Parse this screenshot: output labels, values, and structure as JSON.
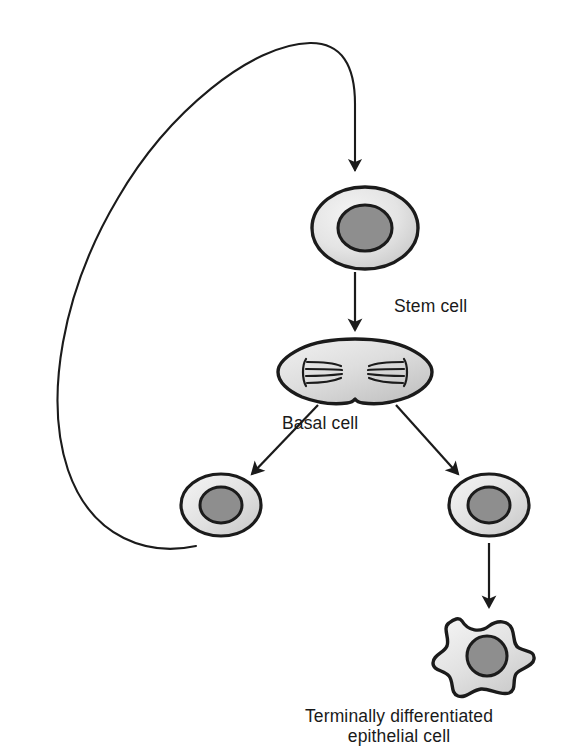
{
  "diagram": {
    "title_implied": "Epithelial stem cell self-renewal and differentiation",
    "background_color": "#ffffff",
    "line_color": "#1b1b1b",
    "labels": {
      "stem_cell": "Stem cell",
      "basal_cell": "Basal cell",
      "terminal_line1": "Terminally differentiated",
      "terminal_line2": "epithelial cell"
    },
    "cells": [
      {
        "id": "stem-cell",
        "name": "Stem cell",
        "shape": "oval",
        "cx": 365,
        "cy": 228,
        "rx": 53,
        "ry": 41,
        "nucleus_rx": 27,
        "nucleus_ry": 23,
        "cytoplasm_light": "#f1f1f1",
        "cytoplasm_dark": "#c9c9c9",
        "nucleus_color": "#8e8e8e",
        "outline_width": 3.4
      },
      {
        "id": "basal-cell-dividing",
        "name": "Basal cell (dividing, with mitotic spindles)",
        "shape": "dumbbell",
        "cx": 355,
        "cy": 372,
        "half_width": 77,
        "lobe_ry": 33,
        "waist_ry": 12,
        "cytoplasm_light": "#efefef",
        "cytoplasm_dark": "#c2c2c2",
        "spindle_color": "#1b1b1b",
        "spindle_fibers_per_pole": 4,
        "outline_width": 3.4
      },
      {
        "id": "daughter-cell-left",
        "name": "Daughter cell (returns to stem pool)",
        "shape": "oval",
        "cx": 221,
        "cy": 505,
        "rx": 40,
        "ry": 31,
        "nucleus_rx": 21,
        "nucleus_ry": 18,
        "cytoplasm_light": "#f1f1f1",
        "cytoplasm_dark": "#c9c9c9",
        "nucleus_color": "#8e8e8e",
        "outline_width": 3.2
      },
      {
        "id": "daughter-cell-right",
        "name": "Daughter cell (differentiating)",
        "shape": "oval",
        "cx": 489,
        "cy": 505,
        "rx": 40,
        "ry": 31,
        "nucleus_rx": 21,
        "nucleus_ry": 18,
        "cytoplasm_light": "#f1f1f1",
        "cytoplasm_dark": "#c9c9c9",
        "nucleus_color": "#8e8e8e",
        "outline_width": 3.2
      },
      {
        "id": "terminal-epithelial-cell",
        "name": "Terminally differentiated epithelial cell",
        "shape": "star-irregular",
        "cx": 484,
        "cy": 658,
        "nucleus_cx": 487,
        "nucleus_cy": 656,
        "nucleus_r": 20,
        "cytoplasm_light": "#f2f2f2",
        "cytoplasm_dark": "#cdcdcd",
        "nucleus_color": "#8e8e8e",
        "outline_width": 3.4,
        "points": 7
      }
    ],
    "arrows": [
      {
        "id": "arrow-stem-to-basal",
        "name": "Stem cell to basal cell",
        "type": "straight-vertical",
        "x1": 355,
        "y1": 272,
        "x2": 355,
        "y2": 336
      },
      {
        "id": "arrow-basal-to-left-daughter",
        "name": "Basal cell to left daughter cell",
        "type": "straight-diagonal",
        "x1": 318,
        "y1": 405,
        "x2": 249,
        "y2": 478
      },
      {
        "id": "arrow-basal-to-right-daughter",
        "name": "Basal cell to right daughter cell",
        "type": "straight-diagonal",
        "x1": 396,
        "y1": 405,
        "x2": 461,
        "y2": 478
      },
      {
        "id": "arrow-daughter-to-terminal",
        "name": "Right daughter cell to terminally differentiated cell",
        "type": "straight-vertical",
        "x1": 489,
        "y1": 543,
        "x2": 489,
        "y2": 613
      },
      {
        "id": "arrow-self-renewal-feedback",
        "name": "Self-renewal feedback loop back to stem cell",
        "type": "curved-loop",
        "from": "left daughter cell",
        "to": "stem cell",
        "arrowhead_at": {
          "x": 355,
          "y": 178
        }
      }
    ]
  }
}
